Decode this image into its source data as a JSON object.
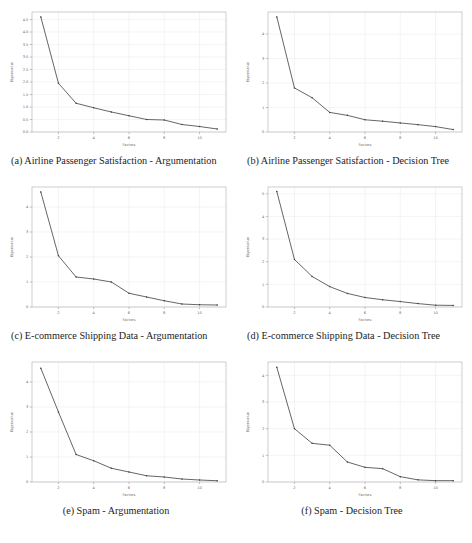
{
  "figure": {
    "background": "#ffffff",
    "curve_color": "#4a4a4a",
    "frame_color": "#b9b9bd",
    "grid_color": "#ececed",
    "subfigures": [
      {
        "key": "a",
        "caption": "(a) Airline Passenger Satisfaction - Argumentation",
        "caption_line1": "(a) Airline Passenger Satisfaction -",
        "caption_line2": "Argumentation"
      },
      {
        "key": "b",
        "caption": "(b) Airline Passenger Satisfaction - Decision Tree",
        "caption_line1": "(b) Airline Passenger Satisfaction -",
        "caption_line2": "Decision Tree"
      },
      {
        "key": "c",
        "caption": "(c) E-commerce Shipping Data - Argumentation",
        "caption_line1": "(c) E-commerce Shipping Data -",
        "caption_line2": "Argumentation"
      },
      {
        "key": "d",
        "caption": "(d) E-commerce Shipping Data - Decision Tree",
        "caption_line1": "(d) E-commerce Shipping Data -",
        "caption_line2": "Decision Tree"
      },
      {
        "key": "e",
        "caption": "(e) Spam - Argumentation",
        "caption_line1": "(e) Spam - Argumentation",
        "caption_line2": ""
      },
      {
        "key": "f",
        "caption": "(f) Spam - Decision Tree",
        "caption_line1": "(f) Spam - Decision Tree",
        "caption_line2": ""
      }
    ]
  },
  "chart_data": [
    {
      "id": "a",
      "type": "line",
      "title": "(a) Airline Passenger Satisfaction - Argumentation",
      "xlabel": "Factors",
      "ylabel": "Eigenvalue",
      "x": [
        1,
        2,
        3,
        4,
        5,
        6,
        7,
        8,
        9,
        10,
        11
      ],
      "values": [
        4.6,
        1.95,
        1.15,
        0.97,
        0.8,
        0.65,
        0.5,
        0.48,
        0.3,
        0.22,
        0.12
      ],
      "xlim": [
        0.5,
        11.5
      ],
      "ylim": [
        0.0,
        4.8
      ],
      "xticks": [
        2,
        4,
        6,
        8,
        10
      ],
      "xticklabels": [
        "2",
        "4",
        "6",
        "8",
        "10"
      ],
      "yticks": [
        0.0,
        0.5,
        1.0,
        1.5,
        2.0,
        2.5,
        3.0,
        3.5,
        4.0,
        4.5
      ],
      "yticklabels": [
        "0.0",
        "0.5",
        "1.0",
        "1.5",
        "2.0",
        "2.5",
        "3.0",
        "3.5",
        "4.0",
        "4.5"
      ],
      "grid": true,
      "legend": "none"
    },
    {
      "id": "b",
      "type": "line",
      "title": "(b) Airline Passenger Satisfaction - Decision Tree",
      "xlabel": "Factors",
      "ylabel": "Eigenvalue",
      "x": [
        1,
        2,
        3,
        4,
        5,
        6,
        7,
        8,
        9,
        10,
        11
      ],
      "values": [
        4.7,
        1.8,
        1.4,
        0.8,
        0.68,
        0.5,
        0.44,
        0.37,
        0.3,
        0.22,
        0.1
      ],
      "xlim": [
        0.5,
        11.5
      ],
      "ylim": [
        0.0,
        4.9
      ],
      "xticks": [
        2,
        4,
        6,
        8,
        10
      ],
      "xticklabels": [
        "2",
        "4",
        "6",
        "8",
        "10"
      ],
      "yticks": [
        0,
        1,
        2,
        3,
        4
      ],
      "yticklabels": [
        "0",
        "1",
        "2",
        "3",
        "4"
      ],
      "grid": true,
      "legend": "none"
    },
    {
      "id": "c",
      "type": "line",
      "title": "(c) E-commerce Shipping Data - Argumentation",
      "xlabel": "Factors",
      "ylabel": "Eigenvalue",
      "x": [
        1,
        2,
        3,
        4,
        5,
        6,
        7,
        8,
        9,
        10,
        11
      ],
      "values": [
        4.6,
        2.05,
        1.2,
        1.12,
        1.0,
        0.55,
        0.4,
        0.25,
        0.12,
        0.09,
        0.08
      ],
      "xlim": [
        0.5,
        11.5
      ],
      "ylim": [
        0.0,
        4.8
      ],
      "xticks": [
        2,
        4,
        6,
        8,
        10
      ],
      "xticklabels": [
        "2",
        "4",
        "6",
        "8",
        "10"
      ],
      "yticks": [
        0,
        1,
        2,
        3,
        4
      ],
      "yticklabels": [
        "0",
        "1",
        "2",
        "3",
        "4"
      ],
      "grid": true,
      "legend": "none"
    },
    {
      "id": "d",
      "type": "line",
      "title": "(d) E-commerce Shipping Data - Decision Tree",
      "xlabel": "Factors",
      "ylabel": "Eigenvalue",
      "x": [
        1,
        2,
        3,
        4,
        5,
        6,
        7,
        8,
        9,
        10,
        11
      ],
      "values": [
        5.1,
        2.1,
        1.35,
        0.9,
        0.6,
        0.42,
        0.32,
        0.24,
        0.15,
        0.08,
        0.07
      ],
      "xlim": [
        0.5,
        11.5
      ],
      "ylim": [
        0.0,
        5.3
      ],
      "xticks": [
        2,
        4,
        6,
        8,
        10
      ],
      "xticklabels": [
        "2",
        "4",
        "6",
        "8",
        "10"
      ],
      "yticks": [
        0,
        1,
        2,
        3,
        4,
        5
      ],
      "yticklabels": [
        "0",
        "1",
        "2",
        "3",
        "4",
        "5"
      ],
      "grid": true,
      "legend": "none"
    },
    {
      "id": "e",
      "type": "line",
      "title": "(e) Spam - Argumentation",
      "xlabel": "Factors",
      "ylabel": "Eigenvalue",
      "x": [
        1,
        2,
        3,
        4,
        5,
        6,
        7,
        8,
        9,
        10,
        11
      ],
      "values": [
        4.55,
        2.8,
        1.1,
        0.85,
        0.55,
        0.4,
        0.25,
        0.2,
        0.12,
        0.08,
        0.05
      ],
      "xlim": [
        0.5,
        11.5
      ],
      "ylim": [
        0.0,
        4.8
      ],
      "xticks": [
        2,
        4,
        6,
        8,
        10
      ],
      "xticklabels": [
        "2",
        "4",
        "6",
        "8",
        "10"
      ],
      "yticks": [
        0,
        1,
        2,
        3,
        4
      ],
      "yticklabels": [
        "0",
        "1",
        "2",
        "3",
        "4"
      ],
      "grid": true,
      "legend": "none"
    },
    {
      "id": "f",
      "type": "line",
      "title": "(f) Spam - Decision Tree",
      "xlabel": "Factors",
      "ylabel": "Eigenvalue",
      "x": [
        1,
        2,
        3,
        4,
        5,
        6,
        7,
        8,
        9,
        10,
        11
      ],
      "values": [
        4.3,
        2.0,
        1.45,
        1.38,
        0.75,
        0.55,
        0.5,
        0.2,
        0.08,
        0.05,
        0.05
      ],
      "xlim": [
        0.5,
        11.5
      ],
      "ylim": [
        0.0,
        4.5
      ],
      "xticks": [
        2,
        4,
        6,
        8,
        10
      ],
      "xticklabels": [
        "2",
        "4",
        "6",
        "8",
        "10"
      ],
      "yticks": [
        0,
        1,
        2,
        3,
        4
      ],
      "yticklabels": [
        "0",
        "1",
        "2",
        "3",
        "4"
      ],
      "grid": true,
      "legend": "none"
    }
  ]
}
